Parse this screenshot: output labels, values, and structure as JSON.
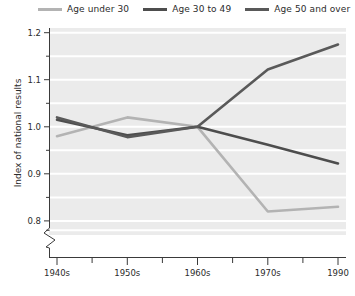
{
  "chart_data": {
    "type": "line",
    "title": "",
    "xlabel": "",
    "ylabel": "Index of national results",
    "categories": [
      "1940s",
      "1950s",
      "1960s",
      "1970s",
      "1990"
    ],
    "xtick_labels": [
      "1940s",
      "1950s",
      "1960s",
      "1970s",
      "1990"
    ],
    "ytick_labels": [
      "0.8",
      "0.9",
      "1.0",
      "1.1",
      "1.2"
    ],
    "ytick_values": [
      0.8,
      0.9,
      1.0,
      1.1,
      1.2
    ],
    "ylim": [
      0.77,
      1.21
    ],
    "y_axis_break": true,
    "grid": true,
    "grid_color": "#ffffff",
    "plot_background": "#ebebeb",
    "legend_position": "top",
    "series": [
      {
        "name": "Age under 30",
        "color": "#b3b3b3",
        "values": [
          0.98,
          1.02,
          1.0,
          0.82,
          0.83
        ]
      },
      {
        "name": "Age 30 to 49",
        "color": "#4d4d4d",
        "values": [
          1.015,
          0.982,
          1.0,
          0.962,
          0.922
        ]
      },
      {
        "name": "Age 50 and over",
        "color": "#595959",
        "values": [
          1.02,
          0.978,
          1.0,
          1.122,
          1.175
        ]
      }
    ]
  },
  "legend": {
    "items": [
      {
        "label": "Age under 30",
        "swatch": "#b3b3b3"
      },
      {
        "label": "Age 30 to 49",
        "swatch": "#4d4d4d"
      },
      {
        "label": "Age 50 and over",
        "swatch": "#595959"
      }
    ]
  },
  "axes": {
    "y_title": "Index of national results",
    "y_ticks": [
      "1.2",
      "1.1",
      "1.0",
      "0.9",
      "0.8"
    ],
    "x_ticks": [
      "1940s",
      "1950s",
      "1960s",
      "1970s",
      "1990"
    ]
  }
}
